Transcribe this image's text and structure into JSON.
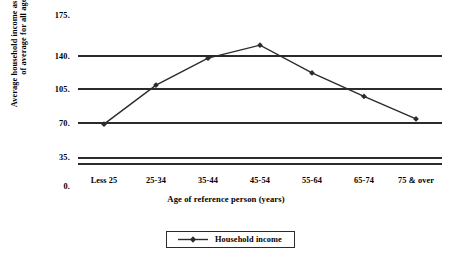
{
  "chart_data": {
    "type": "line",
    "title": "",
    "subtitle": "",
    "xlabel": "Age of reference person (years)",
    "ylabel_lines": [
      "Average household income as perentage",
      "of average for all ages"
    ],
    "ylabel": "Average household income as perentage of average for all ages",
    "categories": [
      "Less 25",
      "25-34",
      "35-44",
      "45-54",
      "55-64",
      "65-74",
      "75 & over"
    ],
    "series": [
      {
        "name": "Household income",
        "values": [
          47,
          92,
          123,
          138,
          106,
          79,
          53
        ]
      }
    ],
    "y_ticks": [
      "0.",
      "35.",
      "70.",
      "105.",
      "140.",
      "175."
    ],
    "y_tick_values": [
      0,
      35,
      70,
      105,
      140,
      175
    ],
    "ylim": [
      0,
      175
    ],
    "grid": true,
    "gridlines_at": [
      35,
      70,
      105,
      140
    ],
    "legend_position": "bottom-center",
    "legend_entries": [
      "Household income"
    ],
    "line_color": "#2b2b2b",
    "marker": "diamond",
    "marker_color": "#2b2b2b",
    "background": "#ffffff"
  }
}
